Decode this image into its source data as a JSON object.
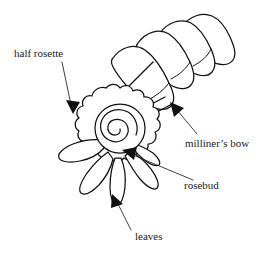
{
  "figure": {
    "type": "line-drawing-diagram",
    "background_color": "#ffffff",
    "ink_color": "#111111",
    "text_color": "#1a1a1a",
    "width": 272,
    "height": 253
  },
  "labels": [
    {
      "id": "half-rosette",
      "text": "half rosette",
      "x": 14,
      "y": 57,
      "anchor": "start",
      "leader_from": [
        62,
        62
      ],
      "leader_to": [
        73,
        111
      ],
      "arrow_angle_deg": 77
    },
    {
      "id": "milliners-bow",
      "text": "milliner’s bow",
      "x": 185,
      "y": 147,
      "anchor": "start",
      "leader_from": [
        197,
        134
      ],
      "leader_to": [
        172,
        104
      ],
      "arrow_angle_deg": 230
    },
    {
      "id": "rosebud",
      "text": "rosebud",
      "x": 184,
      "y": 189,
      "anchor": "start",
      "leader_from": [
        193,
        180
      ],
      "leader_to": [
        122,
        150
      ],
      "arrow_angle_deg": 203
    },
    {
      "id": "leaves",
      "text": "leaves",
      "x": 135,
      "y": 240,
      "anchor": "start",
      "leader_from": [
        131,
        230
      ],
      "leader_to": [
        113,
        195
      ],
      "arrow_angle_deg": 243
    }
  ],
  "parts": [
    {
      "id": "milliners-bow",
      "name": "milliner's bow",
      "description": "stack of four folded ribbon loops angled up to the right"
    },
    {
      "id": "half-rosette",
      "name": "half rosette",
      "description": "scalloped circular gathered ribbon disc"
    },
    {
      "id": "rosebud",
      "name": "rosebud",
      "description": "coiled spiral at the centre of the rosette"
    },
    {
      "id": "leaves",
      "name": "leaves",
      "description": "five pointed leaves fanned beneath the rosette"
    }
  ]
}
